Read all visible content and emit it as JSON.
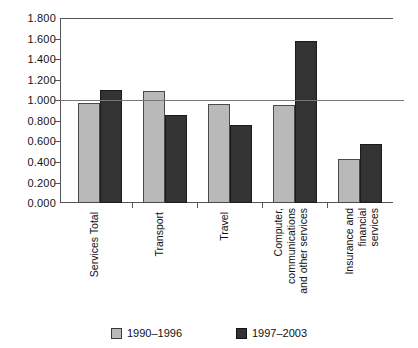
{
  "chart_data": {
    "type": "bar",
    "title": "",
    "xlabel": "",
    "ylabel": "",
    "ylim": [
      0.0,
      1.8
    ],
    "ytick_labels": [
      "0.000",
      "0.200",
      "0.400",
      "0.600",
      "0.800",
      "1.000",
      "1.200",
      "1.400",
      "1.600",
      "1.800"
    ],
    "ytick_values": [
      0.0,
      0.2,
      0.4,
      0.6,
      0.8,
      1.0,
      1.2,
      1.4,
      1.6,
      1.8
    ],
    "grid": "single horizontal reference line at 1.000",
    "legend_position": "bottom-center",
    "categories": [
      "Services Total",
      "Transport",
      "Travel",
      "Computer, communications and other services",
      "Insurance and financial services"
    ],
    "category_label_lines": [
      [
        "Services Total"
      ],
      [
        "Transport"
      ],
      [
        "Travel"
      ],
      [
        "Computer,",
        "communications",
        "and other services"
      ],
      [
        "Insurance and",
        "financial",
        "services"
      ]
    ],
    "series": [
      {
        "name": "1990–1996",
        "color": "#b9b9b9",
        "values": [
          0.97,
          1.09,
          0.96,
          0.95,
          0.43
        ]
      },
      {
        "name": "1997–2003",
        "color": "#333333",
        "values": [
          1.1,
          0.86,
          0.76,
          1.58,
          0.57
        ]
      }
    ],
    "reference_line": 1.0
  },
  "legend": {
    "items": [
      {
        "label": "1990–1996",
        "swatch": "light-gray-swatch"
      },
      {
        "label": "1997–2003",
        "swatch": "dark-swatch"
      }
    ]
  }
}
